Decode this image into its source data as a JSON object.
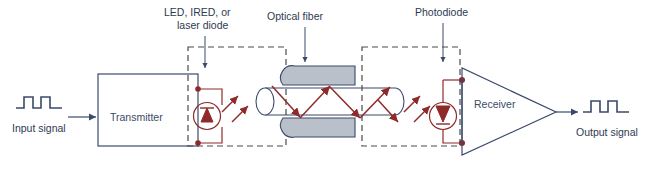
{
  "figure": {
    "background_color": "#ffffff"
  },
  "colors": {
    "line_blue": "#3b4a6b",
    "line_red": "#8e2a2a",
    "dashed_gray": "#4a4a4a",
    "fiber_gray_fill": "#b9c0ca",
    "text": "#2e3a52"
  },
  "labels": {
    "led": "LED, IRED, or\nlaser diode",
    "led_line1": "LED, IRED, or",
    "led_line2": "laser diode",
    "optical_fiber": "Optical fiber",
    "photodiode": "Photodiode",
    "transmitter": "Transmitter",
    "receiver": "Receiver",
    "input_signal": "Input signal",
    "output_signal": "Output signal"
  },
  "components": [
    {
      "id": "input-waveform",
      "name": "input-signal-waveform",
      "type": "digital-pulse-train",
      "caption": "Input signal",
      "pulses": 2
    },
    {
      "id": "transmitter",
      "name": "transmitter-block",
      "type": "rectangle-block",
      "caption": "Transmitter"
    },
    {
      "id": "led",
      "name": "led-emitter",
      "type": "led-diode-symbol",
      "caption": "LED, IRED, or laser diode",
      "emission_rays": 2
    },
    {
      "id": "fiber",
      "name": "optical-fiber",
      "type": "cylinder-with-total-internal-reflection",
      "caption": "Optical fiber",
      "reflection_bounces": 4
    },
    {
      "id": "photodiode",
      "name": "photodiode-detector",
      "type": "photodiode-symbol",
      "caption": "Photodiode",
      "incident_rays": 2
    },
    {
      "id": "receiver",
      "name": "receiver-amplifier",
      "type": "triangle-amplifier",
      "caption": "Receiver"
    },
    {
      "id": "output-waveform",
      "name": "output-signal-waveform",
      "type": "digital-pulse-train",
      "caption": "Output signal",
      "pulses": 2
    }
  ],
  "annotations": {
    "coupling_box_left": "dashed coupling region around emitter and fiber input",
    "coupling_box_right": "dashed coupling region around fiber output and detector"
  }
}
